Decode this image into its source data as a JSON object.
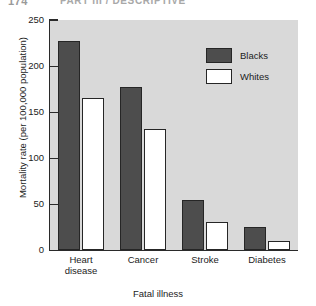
{
  "header": {
    "folio": "174",
    "running_head": "PART III / DESCRIPTIVE"
  },
  "chart_data": {
    "type": "bar",
    "title": "",
    "xlabel": "Fatal illness",
    "ylabel": "Mortality rate (per 100,000 population)",
    "categories": [
      "Heart disease",
      "Cancer",
      "Stroke",
      "Diabetes"
    ],
    "category_lines": [
      [
        "Heart",
        "disease"
      ],
      [
        "Cancer"
      ],
      [
        "Stroke"
      ],
      [
        "Diabetes"
      ]
    ],
    "series": [
      {
        "name": "Blacks",
        "color": "#4d4d4d",
        "values": [
          227,
          177,
          54,
          25
        ]
      },
      {
        "name": "Whites",
        "color": "#ffffff",
        "values": [
          165,
          131,
          30,
          10
        ]
      }
    ],
    "ylim": [
      0,
      250
    ],
    "yticks": [
      0,
      50,
      100,
      150,
      200,
      250
    ],
    "ytick_labels": [
      "0",
      "50",
      "100",
      "150",
      "200",
      "250"
    ],
    "grid": false,
    "legend_position": "upper-right",
    "plot_background": "#d9d9d9",
    "axis_color": "#2a2a2a"
  },
  "legend": {
    "entries": [
      {
        "label": "Blacks"
      },
      {
        "label": "Whites"
      }
    ]
  }
}
